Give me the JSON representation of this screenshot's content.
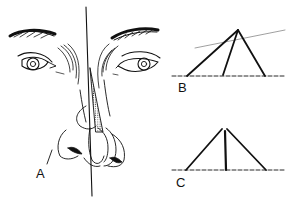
{
  "figure": {
    "labels": {
      "a": "A",
      "b": "B",
      "c": "C"
    },
    "colors": {
      "ink": "#111111",
      "background": "#ffffff",
      "guide": "#888888"
    }
  }
}
